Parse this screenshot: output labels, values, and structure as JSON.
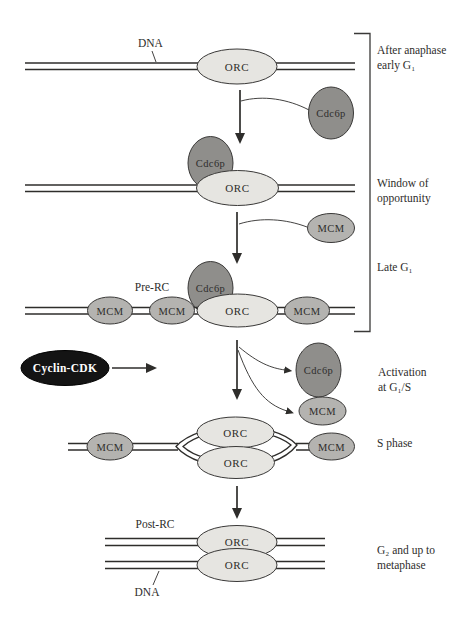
{
  "colors": {
    "orc_fill": "#e6e5e1",
    "mcm_fill": "#b4b3b0",
    "cdc6_fill": "#8f8e8b",
    "cyclin_fill": "#141414",
    "ink": "#2e2d2b"
  },
  "proteins": {
    "orc": "ORC",
    "mcm": "MCM",
    "cdc6": "Cdc6p",
    "cyclin_cdk": "Cyclin-CDK"
  },
  "labels": {
    "dna_top": "DNA",
    "dna_bottom": "DNA",
    "pre_rc": "Pre-RC",
    "post_rc": "Post-RC"
  },
  "stages": {
    "after_anaphase": {
      "line1": "After anaphase",
      "line2": "early G₁"
    },
    "window": {
      "line1": "Window of",
      "line2": "opportunity"
    },
    "late_g1": {
      "line1": "Late G₁"
    },
    "activation": {
      "line1": "Activation",
      "line2": "at G₁/S"
    },
    "s_phase": {
      "line1": "S phase"
    },
    "g2_metaphase": {
      "line1": "G₂ and up to",
      "line2": "metaphase"
    }
  }
}
